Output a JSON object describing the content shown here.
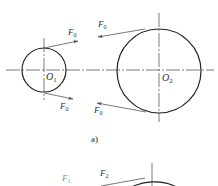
{
  "figure": {
    "caption_a": "a)",
    "colors": {
      "circle": "#222222",
      "centerline": "#444444",
      "force_line": "#555555",
      "label": "#333333"
    },
    "part_a": {
      "pulley_small": {
        "center_label": "O",
        "center_sub": "1"
      },
      "pulley_large": {
        "center_label": "O",
        "center_sub": "2"
      },
      "forces": [
        {
          "id": "upper-left",
          "label": "F",
          "sub": "0"
        },
        {
          "id": "lower-left",
          "label": "F",
          "sub": "0"
        },
        {
          "id": "upper-right",
          "label": "F",
          "sub": "0"
        },
        {
          "id": "lower-right",
          "label": "F",
          "sub": "0"
        }
      ]
    },
    "part_b": {
      "forces": [
        {
          "id": "tight-side",
          "label": "F",
          "sub": "2"
        },
        {
          "id": "slack-side",
          "label": "F",
          "sub": "1"
        }
      ]
    }
  }
}
